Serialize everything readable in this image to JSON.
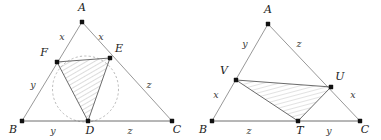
{
  "figure": {
    "background_color": "#ffffff",
    "stroke_color": "#8c8c8c",
    "label_color": "#1a1a1a",
    "hatch_color": "#9a9a9a",
    "dashed_circle_color": "#a8a8a8"
  },
  "left_diagram": {
    "name": "triangle-ABC-with-incircle",
    "vertices": [
      {
        "id": "A",
        "label": "A",
        "x": 82,
        "y": 22,
        "label_x": 82,
        "label_y": 11
      },
      {
        "id": "B",
        "label": "B",
        "x": 22,
        "y": 121,
        "label_x": 13,
        "label_y": 133
      },
      {
        "id": "C",
        "label": "C",
        "x": 172,
        "y": 121,
        "label_x": 177,
        "label_y": 133
      },
      {
        "id": "D",
        "label": "D",
        "x": 88,
        "y": 121,
        "label_x": 90,
        "label_y": 134
      },
      {
        "id": "E",
        "label": "E",
        "x": 110,
        "y": 58,
        "label_x": 119,
        "label_y": 52
      },
      {
        "id": "F",
        "label": "F",
        "x": 57,
        "y": 62,
        "label_x": 44,
        "label_y": 56
      }
    ],
    "segment_labels": [
      {
        "text": "x",
        "x": 62,
        "y": 40
      },
      {
        "text": "x",
        "x": 101,
        "y": 40
      },
      {
        "text": "y",
        "x": 33,
        "y": 88
      },
      {
        "text": "z",
        "x": 149,
        "y": 88
      },
      {
        "text": "y",
        "x": 53,
        "y": 134
      },
      {
        "text": "z",
        "x": 130,
        "y": 134
      }
    ],
    "incircle": {
      "cx": 85.5,
      "cy": 89,
      "r": 33
    },
    "shaded_triangle": [
      "F",
      "E",
      "D"
    ]
  },
  "right_diagram": {
    "name": "triangle-ABC-with-inner-triangle-TUV",
    "vertices": [
      {
        "id": "A",
        "label": "A",
        "x": 268,
        "y": 24,
        "label_x": 268,
        "label_y": 13
      },
      {
        "id": "B",
        "label": "B",
        "x": 212,
        "y": 121,
        "label_x": 203,
        "label_y": 133
      },
      {
        "id": "C",
        "label": "C",
        "x": 360,
        "y": 121,
        "label_x": 365,
        "label_y": 133
      },
      {
        "id": "T",
        "label": "T",
        "x": 298,
        "y": 121,
        "label_x": 300,
        "label_y": 134
      },
      {
        "id": "U",
        "label": "U",
        "x": 331,
        "y": 87,
        "label_x": 340,
        "label_y": 80
      },
      {
        "id": "V",
        "label": "V",
        "x": 236,
        "y": 80,
        "label_x": 224,
        "label_y": 74
      }
    ],
    "segment_labels": [
      {
        "text": "y",
        "x": 245,
        "y": 47
      },
      {
        "text": "z",
        "x": 299,
        "y": 47
      },
      {
        "text": "x",
        "x": 216,
        "y": 98
      },
      {
        "text": "x",
        "x": 353,
        "y": 98
      },
      {
        "text": "z",
        "x": 249,
        "y": 134
      },
      {
        "text": "y",
        "x": 329,
        "y": 134
      }
    ],
    "shaded_triangle": [
      "V",
      "U",
      "T"
    ]
  }
}
